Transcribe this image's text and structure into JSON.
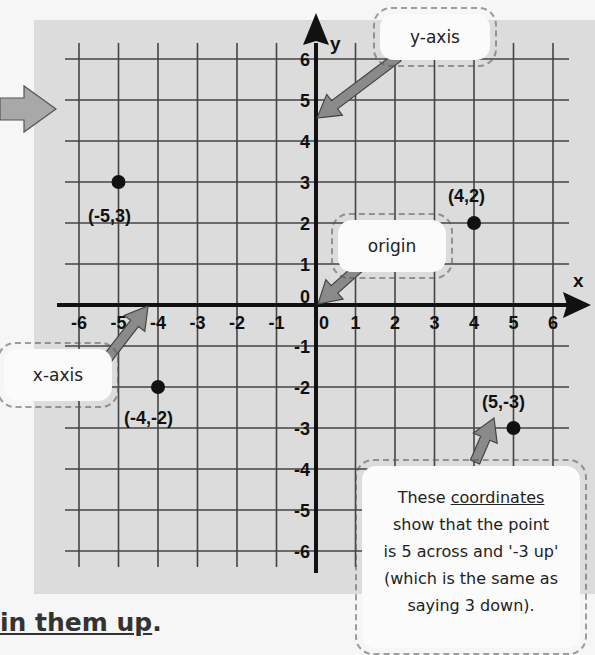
{
  "chart_data": {
    "type": "scatter",
    "title": "",
    "xlabel": "x",
    "ylabel": "y",
    "xlim": [
      -6,
      6
    ],
    "ylim": [
      -6,
      6
    ],
    "grid": true,
    "x_ticks": [
      "-6",
      "-5",
      "-4",
      "-3",
      "-2",
      "-1",
      "0",
      "1",
      "2",
      "3",
      "4",
      "5",
      "6"
    ],
    "y_ticks": [
      "6",
      "5",
      "4",
      "3",
      "2",
      "1",
      "0",
      "-1",
      "-2",
      "-3",
      "-4",
      "-5",
      "-6"
    ],
    "points": [
      {
        "x": -5,
        "y": 3,
        "label": "(-5,3)"
      },
      {
        "x": 4,
        "y": 2,
        "label": "(4,2)"
      },
      {
        "x": -4,
        "y": -2,
        "label": "(-4,-2)"
      },
      {
        "x": 5,
        "y": -3,
        "label": "(5,-3)"
      }
    ],
    "annotations": [
      {
        "text": "y-axis",
        "target": "y-axis"
      },
      {
        "text": "origin",
        "target": "(0,0)"
      },
      {
        "text": "x-axis",
        "target": "x-axis"
      }
    ]
  },
  "callouts": {
    "y_axis": "y-axis",
    "origin": "origin",
    "x_axis": "x-axis",
    "note": {
      "line1_pre": "These ",
      "line1_link": "coordinates",
      "line2": "show that the point",
      "line3": "is 5 across and '-3 up'",
      "line4": "(which is the same as",
      "line5": "saying 3 down)."
    }
  },
  "footer": {
    "text": "in them up",
    "punct": "."
  },
  "colors": {
    "panel": "#dcdcdc",
    "grid": "#444444",
    "axis": "#111111",
    "arrow": "#8a8a8a",
    "callout": "#fbfbfb"
  }
}
